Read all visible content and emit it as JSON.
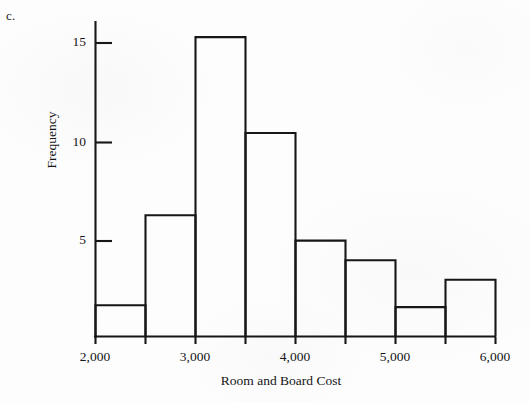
{
  "figure": {
    "part_label": "c.",
    "ink_color": "#171717",
    "background_color": "#fdfdfd"
  },
  "chart_data": {
    "type": "bar",
    "title": "",
    "subtitle": "",
    "xlabel": "Room and Board Cost",
    "ylabel": "Frequency",
    "histogram": true,
    "bin_width": 500,
    "bin_edges": [
      2000,
      2500,
      3000,
      3500,
      4000,
      4500,
      5000,
      5500,
      6000
    ],
    "categories": [
      "2000-2500",
      "2500-3000",
      "3000-3500",
      "3500-4000",
      "4000-4500",
      "4500-5000",
      "5000-5500",
      "5500-6000"
    ],
    "values": [
      1.6,
      6.2,
      15.3,
      10.4,
      4.9,
      3.9,
      1.5,
      2.9
    ],
    "xlim": [
      2000,
      6000
    ],
    "ylim": [
      0,
      16.2
    ],
    "xticks": [
      2000,
      3000,
      4000,
      5000,
      6000
    ],
    "xtick_labels": [
      "2,000",
      "3,000",
      "4,000",
      "5,000",
      "6,000"
    ],
    "yticks": [
      5,
      10,
      15
    ],
    "ytick_labels": [
      "5",
      "10",
      "15"
    ],
    "grid": false,
    "legend": false,
    "legend_position": "none",
    "bar_fill": "none",
    "bar_edge_color": "#171717"
  }
}
